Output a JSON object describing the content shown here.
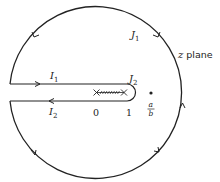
{
  "diagram": {
    "type": "keyhole contour in complex plane",
    "plane_label": {
      "var": "z",
      "text": "plane"
    },
    "contour_labels": {
      "J1": {
        "main": "J",
        "sub": "1"
      },
      "J2": {
        "main": "J",
        "sub": "2"
      },
      "I1": {
        "main": "I",
        "sub": "1"
      },
      "I2": {
        "main": "I",
        "sub": "2"
      }
    },
    "axis_points": {
      "zero": "0",
      "one": "1"
    },
    "pole": {
      "numerator": "a",
      "denominator": "b"
    },
    "branch_cut": "from 0 to 1 (marked with crosses at endpoints)",
    "colors": {
      "stroke": "#222222",
      "background": "#ffffff"
    }
  }
}
